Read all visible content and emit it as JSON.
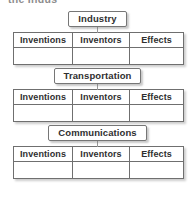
{
  "document": {
    "type": "graphic-organizer",
    "title_fragment": "the Indus",
    "columns": [
      "Inventions",
      "Inventors",
      "Effects"
    ],
    "sections": [
      {
        "label": "Industry",
        "columns": [
          "Inventions",
          "Inventors",
          "Effects"
        ],
        "rows": [
          [
            "",
            "",
            ""
          ]
        ]
      },
      {
        "label": "Transportation",
        "columns": [
          "Inventions",
          "Inventors",
          "Effects"
        ],
        "rows": [
          [
            "",
            "",
            ""
          ]
        ]
      },
      {
        "label": "Communications",
        "columns": [
          "Inventions",
          "Inventors",
          "Effects"
        ],
        "rows": [
          [
            "",
            "",
            ""
          ]
        ]
      }
    ]
  },
  "style": {
    "border_color": "#6f6f6f",
    "text_color": "#2f2f2f",
    "background": "#ffffff",
    "shadow_color": "#6e6e6e"
  }
}
